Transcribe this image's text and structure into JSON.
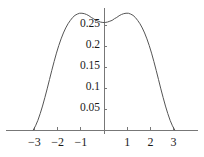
{
  "chart_data": {
    "type": "line",
    "title": "",
    "xlabel": "",
    "ylabel": "",
    "xlim": [
      -3.35,
      3.35
    ],
    "ylim": [
      0,
      0.295
    ],
    "grid": false,
    "legend": null,
    "xticks": [
      -3,
      -2,
      -1,
      1,
      2,
      3
    ],
    "xticklabels": [
      "−3",
      "−2",
      "−1",
      "1",
      "2",
      "3"
    ],
    "yticks": [
      0.05,
      0.1,
      0.15,
      0.2,
      0.25
    ],
    "yticklabels": [
      "0.05",
      "0.1",
      "0.15",
      "0.2",
      "0.25"
    ],
    "line_color": "#555555",
    "axis_color": "#777777",
    "series": [
      {
        "name": "density",
        "x": [
          -3.05,
          -2.95,
          -2.85,
          -2.75,
          -2.65,
          -2.55,
          -2.45,
          -2.35,
          -2.25,
          -2.15,
          -2.05,
          -1.95,
          -1.85,
          -1.75,
          -1.65,
          -1.55,
          -1.45,
          -1.35,
          -1.25,
          -1.15,
          -1.05,
          -0.95,
          -0.85,
          -0.75,
          -0.65,
          -0.55,
          -0.45,
          -0.35,
          -0.25,
          -0.15,
          -0.05,
          0.05,
          0.15,
          0.25,
          0.35,
          0.45,
          0.55,
          0.65,
          0.75,
          0.85,
          0.95,
          1.05,
          1.15,
          1.25,
          1.35,
          1.45,
          1.55,
          1.65,
          1.75,
          1.85,
          1.95,
          2.05,
          2.15,
          2.25,
          2.35,
          2.45,
          2.55,
          2.65,
          2.75,
          2.85,
          2.95,
          3.05
        ],
        "y": [
          0.0,
          0.01,
          0.023,
          0.039,
          0.057,
          0.077,
          0.098,
          0.12,
          0.142,
          0.163,
          0.183,
          0.201,
          0.217,
          0.231,
          0.243,
          0.253,
          0.261,
          0.268,
          0.273,
          0.276,
          0.278,
          0.278,
          0.277,
          0.275,
          0.272,
          0.268,
          0.265,
          0.261,
          0.259,
          0.257,
          0.256,
          0.256,
          0.257,
          0.259,
          0.261,
          0.265,
          0.268,
          0.272,
          0.275,
          0.277,
          0.278,
          0.278,
          0.276,
          0.273,
          0.268,
          0.261,
          0.253,
          0.243,
          0.231,
          0.217,
          0.201,
          0.183,
          0.163,
          0.142,
          0.12,
          0.098,
          0.077,
          0.057,
          0.039,
          0.023,
          0.01,
          0.0
        ]
      }
    ]
  }
}
